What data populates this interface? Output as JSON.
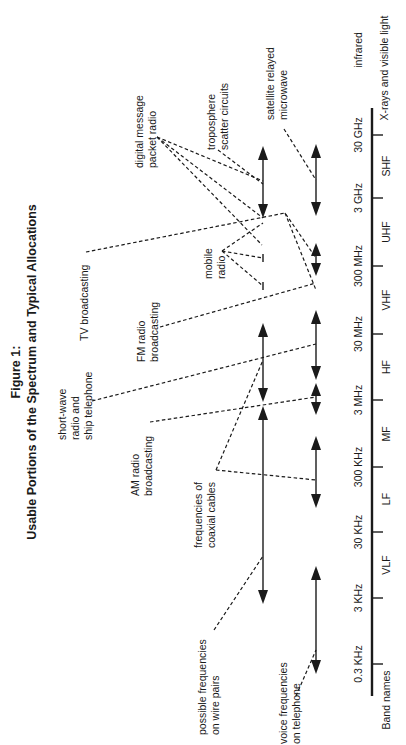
{
  "figure": {
    "title_line1": "Figure 1:",
    "title_line2": "Usable Portions of the Spectrum and Typical Allocations",
    "orientation": "rotated 90° counter-clockwise"
  },
  "axis": {
    "row_label": "Band names",
    "frequency_ticks": [
      "0.3 KHz",
      "3 KHz",
      "30 KHz",
      "300 KHz",
      "3 MHz",
      "30 MHz",
      "300 MHz",
      "3 GHz",
      "30 GHz",
      "infrared"
    ],
    "bands": [
      "VLF",
      "LF",
      "MF",
      "HF",
      "VHF",
      "UHF",
      "SHF",
      "X-rays and visible light"
    ]
  },
  "labels": {
    "digital_message": [
      "digital message",
      "packet radio"
    ],
    "troposphere": [
      "troposphere",
      "scatter circuits"
    ],
    "satellite": [
      "satellite relayed",
      "microwave"
    ],
    "tv": [
      "TV broadcasting"
    ],
    "shortwave": [
      "short-wave",
      "radio and",
      "ship telephone"
    ],
    "fm": [
      "FM radio",
      "broadcasting"
    ],
    "mobile": [
      "mobile",
      "radio"
    ],
    "am": [
      "AM radio",
      "broadcasting"
    ],
    "coax": [
      "frequencies of",
      "coaxial cables"
    ],
    "wire_pairs": [
      "possible frequencies",
      "on wire pairs"
    ],
    "voice": [
      "voice frequencies",
      "on telephone"
    ]
  },
  "ranges": [
    {
      "name": "voice frequencies on telephone",
      "from": "0.3 KHz",
      "to": "3 KHz"
    },
    {
      "name": "possible frequencies on wire pairs",
      "from": "~1 KHz",
      "to": "~1 MHz"
    },
    {
      "name": "frequencies of coaxial cables",
      "from": "~30 KHz",
      "to": "~3 GHz"
    },
    {
      "name": "AM radio broadcasting",
      "from": "~530 KHz",
      "to": "~1.6 MHz"
    },
    {
      "name": "short-wave radio and ship telephone",
      "from": "~3 MHz",
      "to": "30 MHz"
    },
    {
      "name": "FM radio broadcasting",
      "from": "~88 MHz",
      "to": "~108 MHz"
    },
    {
      "name": "TV broadcasting",
      "from": "~54 MHz",
      "to": "~890 MHz"
    },
    {
      "name": "mobile radio",
      "from": "VHF/UHF",
      "to": "UHF"
    },
    {
      "name": "digital message packet radio",
      "from": "VHF",
      "to": "UHF"
    },
    {
      "name": "troposphere scatter circuits",
      "from": "~300 MHz",
      "to": "~10 GHz"
    },
    {
      "name": "satellite relayed microwave",
      "from": "~1 GHz",
      "to": "~30 GHz"
    }
  ]
}
